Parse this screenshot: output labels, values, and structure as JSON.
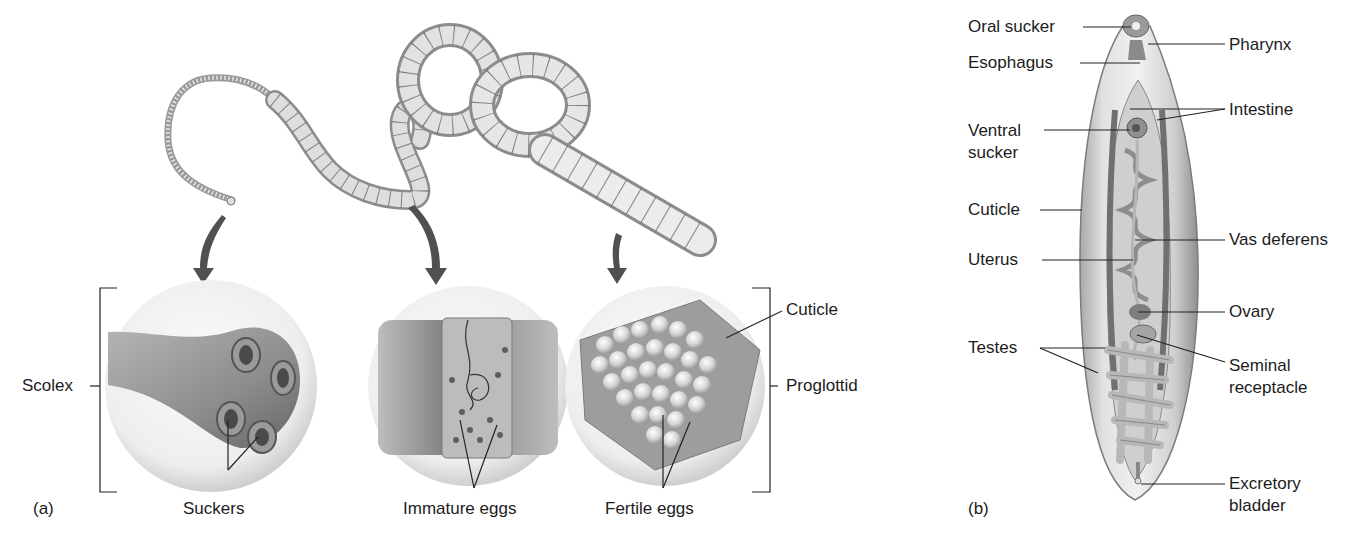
{
  "figure": {
    "panel_a": {
      "panel_label": "(a)",
      "title_subject": "Tapeworm",
      "labels": {
        "scolex": "Scolex",
        "suckers": "Suckers",
        "immature_eggs": "Immature eggs",
        "fertile_eggs": "Fertile eggs",
        "cuticle": "Cuticle",
        "proglottid": "Proglottid"
      }
    },
    "panel_b": {
      "panel_label": "(b)",
      "title_subject": "Fluke",
      "labels": {
        "oral_sucker": "Oral sucker",
        "pharynx": "Pharynx",
        "esophagus": "Esophagus",
        "intestine": "Intestine",
        "ventral_sucker_1": "Ventral",
        "ventral_sucker_2": "sucker",
        "cuticle": "Cuticle",
        "vas_deferens": "Vas deferens",
        "uterus": "Uterus",
        "ovary": "Ovary",
        "testes": "Testes",
        "seminal_receptacle_1": "Seminal",
        "seminal_receptacle_2": "receptacle",
        "excretory_bladder_1": "Excretory",
        "excretory_bladder_2": "bladder"
      }
    },
    "colors": {
      "line": "#222222",
      "arrow": "#555555",
      "tissue_light": "#e6e6e6",
      "tissue_mid": "#a8a8a8",
      "tissue_dark": "#6e6e6e",
      "bubble": "#ececec"
    }
  }
}
